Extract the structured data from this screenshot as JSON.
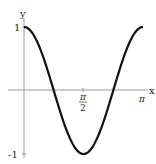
{
  "chart_data": {
    "type": "line",
    "title": "",
    "xlabel": "x",
    "ylabel": "y",
    "function": "cos(2x)",
    "xlim": [
      0,
      3.14159
    ],
    "ylim": [
      -1,
      1
    ],
    "x_ticks": [
      {
        "value": 1.5708,
        "label_num": "π",
        "label_den": "2"
      },
      {
        "value": 3.14159,
        "label": "π"
      }
    ],
    "y_ticks": [
      {
        "value": 1,
        "label": "1"
      },
      {
        "value": -1,
        "label": "-1"
      }
    ],
    "grid": false,
    "legend": null,
    "series": [
      {
        "name": "cos(2x)",
        "x": [
          0,
          0.3927,
          0.7854,
          1.1781,
          1.5708,
          1.9635,
          2.3562,
          2.7489,
          3.14159
        ],
        "values": [
          1,
          0.7071,
          0,
          -0.7071,
          -1,
          -0.7071,
          0,
          0.7071,
          1
        ]
      }
    ],
    "colors": {
      "curve": "#111111",
      "axes": "#999999"
    }
  }
}
